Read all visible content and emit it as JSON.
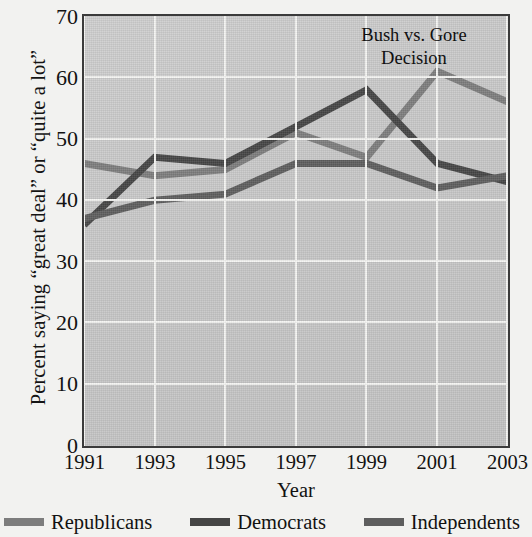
{
  "chart_data": {
    "type": "line",
    "title": "",
    "annotation": "Bush vs. Gore Decision",
    "annotation_line1": "Bush vs. Gore",
    "annotation_line2": "Decision",
    "xlabel": "Year",
    "ylabel": "Percent saying “great deal” or “quite a lot”",
    "x": [
      1991,
      1993,
      1995,
      1997,
      1999,
      2001,
      2003
    ],
    "xticklabels": [
      "1991",
      "1993",
      "1995",
      "1997",
      "1999",
      "2001",
      "2003"
    ],
    "yticklabels": [
      "0",
      "10",
      "20",
      "30",
      "40",
      "50",
      "60",
      "70"
    ],
    "yticks": [
      0,
      10,
      20,
      30,
      40,
      50,
      60,
      70
    ],
    "ylim": [
      0,
      70
    ],
    "xlim": [
      1991,
      2003
    ],
    "grid": true,
    "legend_position": "bottom",
    "series": [
      {
        "name": "Republicans",
        "color": "#7d7d7d",
        "values": [
          46,
          44,
          45,
          51,
          47,
          61,
          56
        ]
      },
      {
        "name": "Democrats",
        "color": "#454545",
        "values": [
          36,
          47,
          46,
          52,
          58,
          46,
          43
        ]
      },
      {
        "name": "Independents",
        "color": "#5e5e5e",
        "values": [
          37,
          40,
          41,
          46,
          46,
          42,
          44
        ]
      }
    ]
  },
  "legend": {
    "items": [
      {
        "label": "Republicans",
        "color": "#7d7d7d"
      },
      {
        "label": "Democrats",
        "color": "#454545"
      },
      {
        "label": "Independents",
        "color": "#5e5e5e"
      }
    ]
  }
}
